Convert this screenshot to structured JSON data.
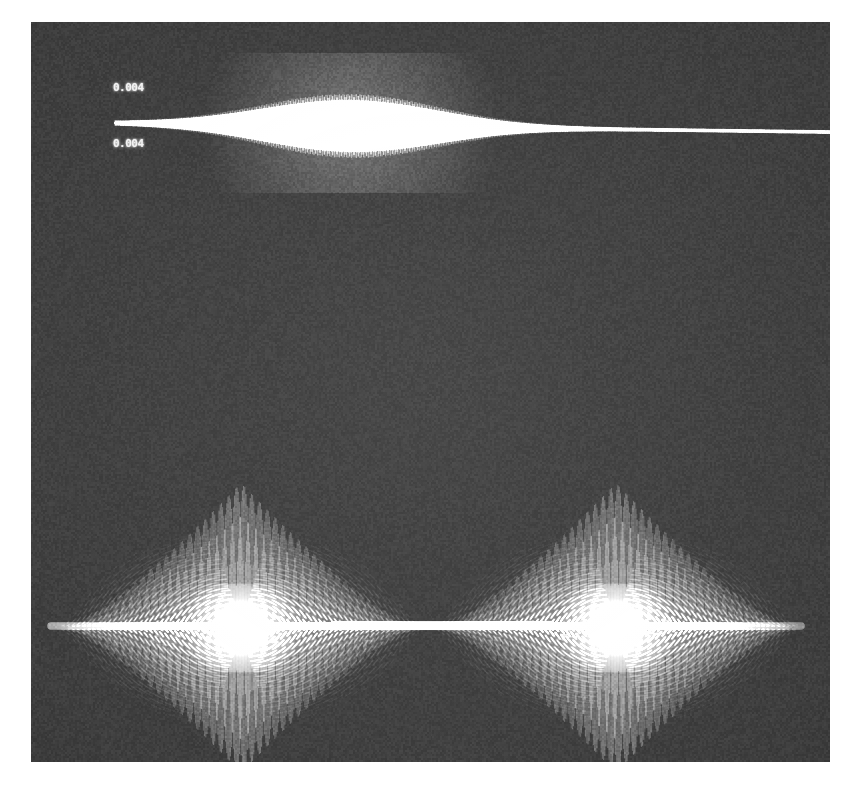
{
  "image": {
    "kind": "photograph-of-oscilloscope-screen",
    "width": 858,
    "height": 789,
    "background_color": "#ffffff",
    "screen_color": "#3b3b3b",
    "trace_color": "#ffffff",
    "screen_rect": {
      "x": 31,
      "y": 22,
      "width": 799,
      "height": 740
    }
  },
  "labels": {
    "top": "0.004",
    "bottom": "0.004"
  },
  "chart_data": {
    "type": "line",
    "title": "",
    "xlabel": "",
    "ylabel": "",
    "traces": [
      {
        "name": "upper-trace",
        "description": "amplitude-modulated carrier with single gaussian envelope burst",
        "baseline_y": 101,
        "x_start": 84,
        "x_end": 799,
        "envelope": {
          "shape": "gaussian",
          "center_x": 320,
          "sigma": 88,
          "peak_amplitude": 30,
          "floor_amplitude": 1.6
        },
        "carrier": {
          "period_px": 3.4,
          "phase": 0
        },
        "baseline_drift": 9
      },
      {
        "name": "lower-trace",
        "description": "two symmetric beat bursts with radial fan interference lobes and saturated cores",
        "baseline_y": 606,
        "x_start": 20,
        "x_end": 770,
        "burst_centers_x": [
          210,
          585
        ],
        "burst_half_width": 175,
        "peak_amplitude": 145,
        "core_glow_radius": 60,
        "carrier": {
          "period_px": 2.6
        },
        "fan_lines": 150,
        "bridge_bar": {
          "x_start": 300,
          "x_end": 520,
          "thickness": 9
        }
      }
    ],
    "grid": false,
    "legend": "none"
  }
}
